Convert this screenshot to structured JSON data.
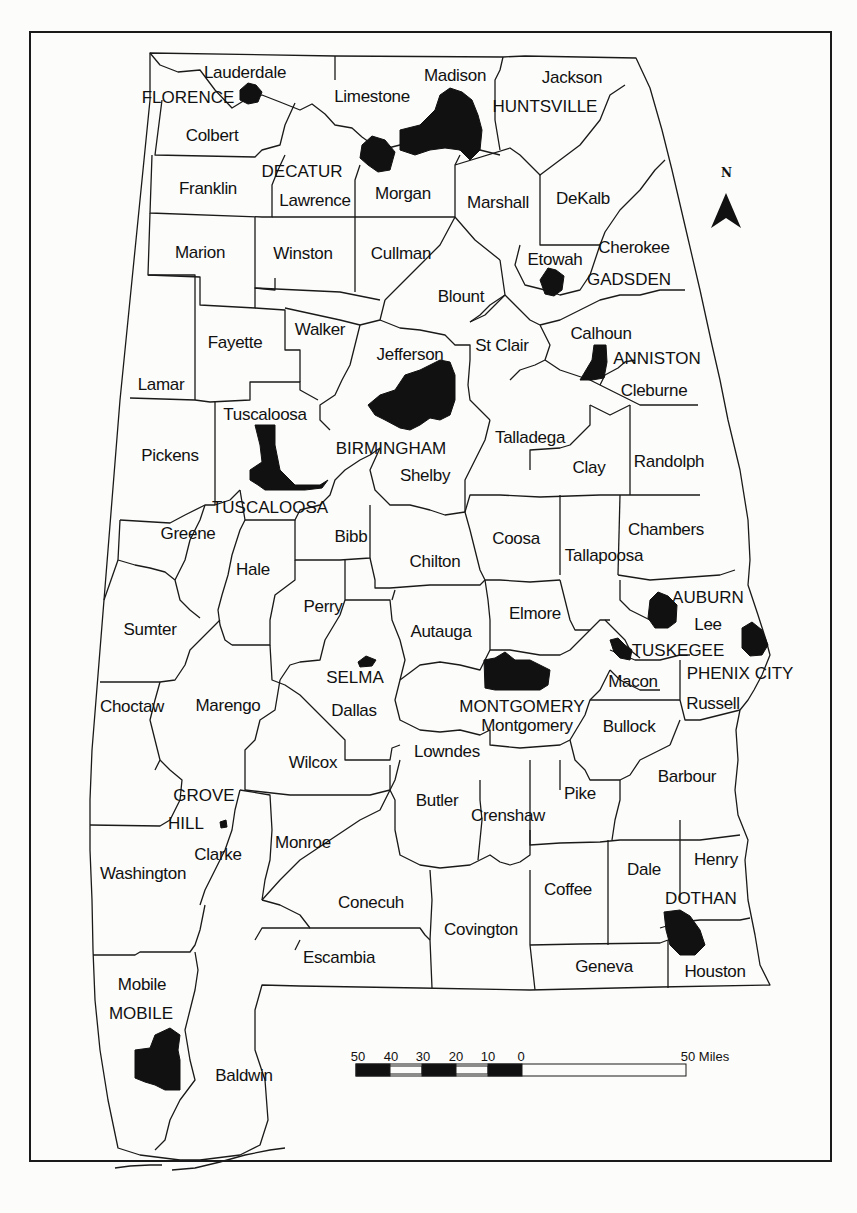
{
  "map": {
    "title": "Alabama counties and major cities",
    "colors": {
      "background": "#fcfcfa",
      "ink": "#111111",
      "city_fill": "#111111"
    },
    "counties": [
      {
        "name": "Lauderdale",
        "x": 245,
        "y": 72
      },
      {
        "name": "Limestone",
        "x": 372,
        "y": 96
      },
      {
        "name": "Madison",
        "x": 455,
        "y": 75
      },
      {
        "name": "Jackson",
        "x": 572,
        "y": 77
      },
      {
        "name": "Colbert",
        "x": 212,
        "y": 135
      },
      {
        "name": "Franklin",
        "x": 208,
        "y": 188
      },
      {
        "name": "Lawrence",
        "x": 315,
        "y": 200
      },
      {
        "name": "Morgan",
        "x": 403,
        "y": 193
      },
      {
        "name": "Marshall",
        "x": 498,
        "y": 202
      },
      {
        "name": "DeKalb",
        "x": 583,
        "y": 198
      },
      {
        "name": "Marion",
        "x": 200,
        "y": 252
      },
      {
        "name": "Winston",
        "x": 303,
        "y": 253
      },
      {
        "name": "Cullman",
        "x": 401,
        "y": 253
      },
      {
        "name": "Cherokee",
        "x": 634,
        "y": 247
      },
      {
        "name": "Etowah",
        "x": 555,
        "y": 259
      },
      {
        "name": "Blount",
        "x": 461,
        "y": 296
      },
      {
        "name": "Fayette",
        "x": 235,
        "y": 342
      },
      {
        "name": "Walker",
        "x": 320,
        "y": 329
      },
      {
        "name": "Jefferson",
        "x": 410,
        "y": 354
      },
      {
        "name": "St Clair",
        "x": 502,
        "y": 345
      },
      {
        "name": "Calhoun",
        "x": 601,
        "y": 333
      },
      {
        "name": "Lamar",
        "x": 161,
        "y": 384
      },
      {
        "name": "Cleburne",
        "x": 654,
        "y": 390
      },
      {
        "name": "Tuscaloosa",
        "x": 265,
        "y": 414
      },
      {
        "name": "Talladega",
        "x": 530,
        "y": 437
      },
      {
        "name": "Pickens",
        "x": 170,
        "y": 455
      },
      {
        "name": "Shelby",
        "x": 425,
        "y": 475
      },
      {
        "name": "Clay",
        "x": 589,
        "y": 467
      },
      {
        "name": "Randolph",
        "x": 669,
        "y": 461
      },
      {
        "name": "Greene",
        "x": 188,
        "y": 533
      },
      {
        "name": "Bibb",
        "x": 351,
        "y": 536
      },
      {
        "name": "Chilton",
        "x": 435,
        "y": 561
      },
      {
        "name": "Coosa",
        "x": 516,
        "y": 538
      },
      {
        "name": "Chambers",
        "x": 666,
        "y": 529
      },
      {
        "name": "Hale",
        "x": 253,
        "y": 569
      },
      {
        "name": "Tallapoosa",
        "x": 604,
        "y": 555
      },
      {
        "name": "Perry",
        "x": 323,
        "y": 606
      },
      {
        "name": "Autauga",
        "x": 441,
        "y": 631
      },
      {
        "name": "Elmore",
        "x": 535,
        "y": 613
      },
      {
        "name": "Lee",
        "x": 708,
        "y": 624
      },
      {
        "name": "Sumter",
        "x": 150,
        "y": 629
      },
      {
        "name": "Macon",
        "x": 633,
        "y": 681
      },
      {
        "name": "Choctaw",
        "x": 132,
        "y": 706
      },
      {
        "name": "Marengo",
        "x": 228,
        "y": 705
      },
      {
        "name": "Dallas",
        "x": 354,
        "y": 710
      },
      {
        "name": "Montgomery",
        "x": 527,
        "y": 725
      },
      {
        "name": "Russell",
        "x": 713,
        "y": 703
      },
      {
        "name": "Bullock",
        "x": 629,
        "y": 726
      },
      {
        "name": "Lowndes",
        "x": 447,
        "y": 751
      },
      {
        "name": "Wilcox",
        "x": 313,
        "y": 762
      },
      {
        "name": "Barbour",
        "x": 687,
        "y": 776
      },
      {
        "name": "Pike",
        "x": 580,
        "y": 793
      },
      {
        "name": "Butler",
        "x": 437,
        "y": 800
      },
      {
        "name": "Crenshaw",
        "x": 508,
        "y": 815
      },
      {
        "name": "Clarke",
        "x": 218,
        "y": 854
      },
      {
        "name": "Monroe",
        "x": 303,
        "y": 842
      },
      {
        "name": "Henry",
        "x": 716,
        "y": 859
      },
      {
        "name": "Dale",
        "x": 644,
        "y": 869
      },
      {
        "name": "Washington",
        "x": 143,
        "y": 873
      },
      {
        "name": "Coffee",
        "x": 568,
        "y": 889
      },
      {
        "name": "Conecuh",
        "x": 371,
        "y": 902
      },
      {
        "name": "Covington",
        "x": 481,
        "y": 929
      },
      {
        "name": "Escambia",
        "x": 339,
        "y": 957
      },
      {
        "name": "Geneva",
        "x": 604,
        "y": 966
      },
      {
        "name": "Houston",
        "x": 715,
        "y": 971
      },
      {
        "name": "Mobile",
        "x": 142,
        "y": 984
      },
      {
        "name": "Baldwin",
        "x": 244,
        "y": 1075
      }
    ],
    "cities": [
      {
        "name": "FLORENCE",
        "x": 188,
        "y": 97
      },
      {
        "name": "HUNTSVILLE",
        "x": 545,
        "y": 106
      },
      {
        "name": "DECATUR",
        "x": 302,
        "y": 171
      },
      {
        "name": "GADSDEN",
        "x": 629,
        "y": 279
      },
      {
        "name": "ANNISTON",
        "x": 657,
        "y": 358
      },
      {
        "name": "BIRMINGHAM",
        "x": 391,
        "y": 448
      },
      {
        "name": "TUSCALOOSA",
        "x": 270,
        "y": 507
      },
      {
        "name": "AUBURN",
        "x": 708,
        "y": 597
      },
      {
        "name": "TUSKEGEE",
        "x": 678,
        "y": 650
      },
      {
        "name": "PHENIX CITY",
        "x": 740,
        "y": 673
      },
      {
        "name": "SELMA",
        "x": 355,
        "y": 677
      },
      {
        "name": "MONTGOMERY",
        "x": 522,
        "y": 706
      },
      {
        "name": "GROVE",
        "x": 204,
        "y": 795
      },
      {
        "name": "HILL",
        "x": 186,
        "y": 823
      },
      {
        "name": "DOTHAN",
        "x": 701,
        "y": 898
      },
      {
        "name": "MOBILE",
        "x": 141,
        "y": 1013
      }
    ],
    "north_arrow": {
      "label": "N"
    },
    "scale_bar": {
      "ticks": [
        "50",
        "40",
        "30",
        "20",
        "10",
        "0"
      ],
      "end_label": "50 Miles"
    }
  }
}
